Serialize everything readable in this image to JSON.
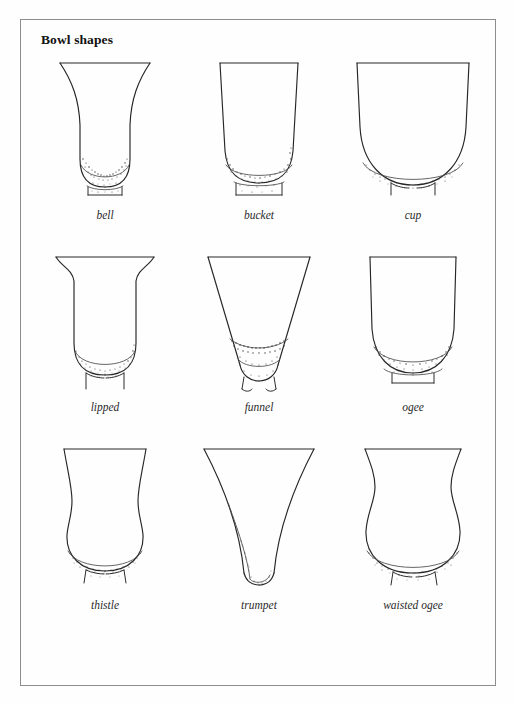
{
  "page": {
    "title": "Bowl shapes",
    "background_color": "#fefefe",
    "frame_color": "#8d8d8d",
    "ink_color": "#262626"
  },
  "figures": [
    {
      "label": "bell",
      "row": 1,
      "column": 1,
      "description": "flared everted rim, narrow waisted body, rounded base on small foot"
    },
    {
      "label": "bucket",
      "row": 1,
      "column": 2,
      "description": "near vertical slightly tapering sides, flat base with small foot ring"
    },
    {
      "label": "cup",
      "row": 1,
      "column": 3,
      "description": "straight upper sides curving to a deep rounded U base"
    },
    {
      "label": "lipped",
      "row": 2,
      "column": 1,
      "description": "pronounced everted lip at rim, straight body, rounded base"
    },
    {
      "label": "funnel",
      "row": 2,
      "column": 2,
      "description": "straight conical tapering sides to a small rounded base"
    },
    {
      "label": "ogee",
      "row": 2,
      "column": 3,
      "description": "straight sides meeting a shallow curved rounded base on a foot"
    },
    {
      "label": "thistle",
      "row": 3,
      "column": 1,
      "description": "flared rim above a concave waist and bulbous rounded lower body"
    },
    {
      "label": "trumpet",
      "row": 3,
      "column": 2,
      "description": "deeply concave flaring sides narrowing to a small rounded base"
    },
    {
      "label": "waisted ogee",
      "row": 3,
      "column": 3,
      "description": "S profile with narrow waist below rim and wide rounded body"
    }
  ]
}
